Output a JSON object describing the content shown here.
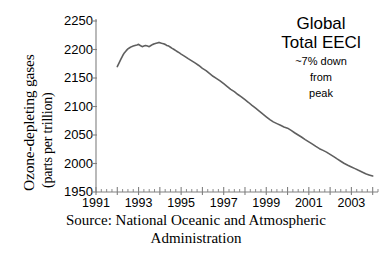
{
  "chart_data": {
    "type": "line",
    "title": "",
    "xlabel": "",
    "ylabel": "Ozone-depleting gases",
    "ylabel_units": "(parts per trillion)",
    "ylim": [
      1950,
      2250
    ],
    "xlim": [
      1991,
      2004.25
    ],
    "yticks": [
      2250,
      2200,
      2150,
      2100,
      2050,
      2000,
      1950
    ],
    "ytick_labels": [
      "2250",
      "2200",
      "2150",
      "2100",
      "2050",
      "2000",
      "1950"
    ],
    "xticks": [
      1991,
      1993,
      1995,
      1997,
      1999,
      2001,
      2003
    ],
    "xtick_labels": [
      "1991",
      "1993",
      "1995",
      "1997",
      "1999",
      "2001",
      "2003"
    ],
    "x_minor_tick_interval": 0.25,
    "grid": false,
    "legend": "none",
    "line_color": "#5f5f5f",
    "line_width": 1.6,
    "axis_color": "#808080",
    "series": [
      {
        "name": "Global Total EECl",
        "x": [
          1992.0,
          1992.08,
          1992.17,
          1992.25,
          1992.33,
          1992.42,
          1992.5,
          1992.58,
          1992.67,
          1992.75,
          1992.83,
          1992.92,
          1993.0,
          1993.08,
          1993.17,
          1993.25,
          1993.33,
          1993.42,
          1993.5,
          1993.58,
          1993.67,
          1993.75,
          1993.83,
          1993.92,
          1994.0,
          1994.08,
          1994.17,
          1994.25,
          1994.33,
          1994.42,
          1994.5,
          1994.58,
          1994.67,
          1994.75,
          1994.83,
          1994.92,
          1995.0,
          1995.17,
          1995.33,
          1995.5,
          1995.67,
          1995.83,
          1996.0,
          1996.17,
          1996.33,
          1996.5,
          1996.67,
          1996.83,
          1997.0,
          1997.17,
          1997.33,
          1997.5,
          1997.67,
          1997.83,
          1998.0,
          1998.17,
          1998.33,
          1998.5,
          1998.67,
          1998.83,
          1999.0,
          1999.17,
          1999.33,
          1999.5,
          1999.67,
          1999.83,
          2000.0,
          2000.17,
          2000.33,
          2000.5,
          2000.67,
          2000.83,
          2001.0,
          2001.17,
          2001.33,
          2001.5,
          2001.67,
          2001.83,
          2002.0,
          2002.17,
          2002.33,
          2002.5,
          2002.67,
          2002.83,
          2003.0,
          2003.17,
          2003.33,
          2003.5,
          2003.67,
          2003.83,
          2004.0
        ],
        "y": [
          2170,
          2176,
          2183,
          2189,
          2194,
          2198,
          2201,
          2203,
          2205,
          2206,
          2207,
          2208,
          2209,
          2207,
          2205,
          2206,
          2207,
          2206,
          2205,
          2207,
          2209,
          2210,
          2211,
          2212,
          2212,
          2211,
          2210,
          2209,
          2207,
          2206,
          2204,
          2202,
          2200,
          2198,
          2196,
          2194,
          2192,
          2188,
          2184,
          2180,
          2176,
          2172,
          2167,
          2163,
          2158,
          2153,
          2149,
          2145,
          2140,
          2135,
          2130,
          2126,
          2121,
          2117,
          2112,
          2107,
          2102,
          2097,
          2092,
          2087,
          2082,
          2077,
          2073,
          2070,
          2067,
          2064,
          2062,
          2058,
          2054,
          2050,
          2046,
          2042,
          2038,
          2034,
          2030,
          2026,
          2023,
          2020,
          2016,
          2012,
          2008,
          2004,
          2000,
          1997,
          1994,
          1991,
          1988,
          1985,
          1982,
          1980,
          1978
        ]
      }
    ],
    "annotations": [
      {
        "name": "peak_value",
        "value": 2212,
        "year": 1994
      },
      {
        "name": "end_value",
        "value": 1978,
        "year": 2004
      }
    ]
  },
  "annotation_box": {
    "title_line1": "Global",
    "title_line2": "Total EECl",
    "sub_line1": "~7% down",
    "sub_line2": "from",
    "sub_line3": "peak"
  },
  "caption": {
    "line1": "Source: National Oceanic and Atmospheric",
    "line2": "Administration"
  }
}
